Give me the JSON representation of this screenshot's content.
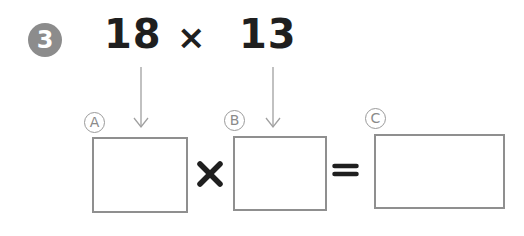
{
  "problem": {
    "number": "3",
    "expression": {
      "operand_a": "18",
      "operator": "×",
      "operand_b": "13"
    },
    "equation": {
      "boxes": [
        {
          "label": "A",
          "value": ""
        },
        {
          "label": "B",
          "value": ""
        },
        {
          "label": "C",
          "value": ""
        }
      ],
      "times_symbol": "×",
      "equals_symbol": "="
    }
  },
  "colors": {
    "number_badge": "#8c8c8c",
    "text": "#1f1f1f",
    "arrow": "#a0a0a0",
    "box_border": "#8f8f8f",
    "label": "#8a8a8a"
  }
}
